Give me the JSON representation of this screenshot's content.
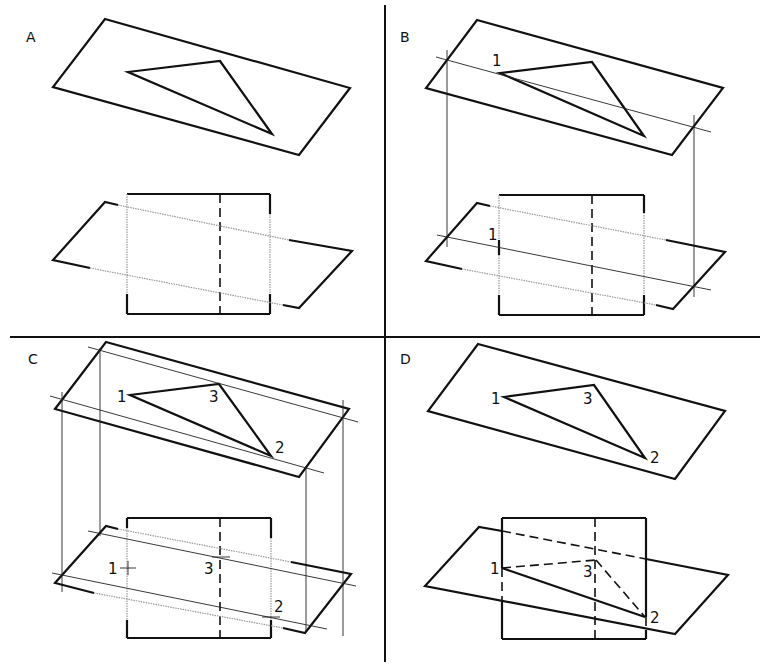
{
  "figure": {
    "panels": [
      {
        "id": "A",
        "label": "A"
      },
      {
        "id": "B",
        "label": "B",
        "points": [
          "1",
          "1"
        ]
      },
      {
        "id": "C",
        "label": "C",
        "points": [
          "1",
          "3",
          "2",
          "1",
          "3",
          "2"
        ]
      },
      {
        "id": "D",
        "label": "D",
        "points": [
          "1",
          "3",
          "2",
          "1",
          "3",
          "2"
        ]
      }
    ]
  },
  "labels": {
    "A": "A",
    "B": "B",
    "C": "C",
    "D": "D",
    "p1": "1",
    "p2": "2",
    "p3": "3"
  }
}
